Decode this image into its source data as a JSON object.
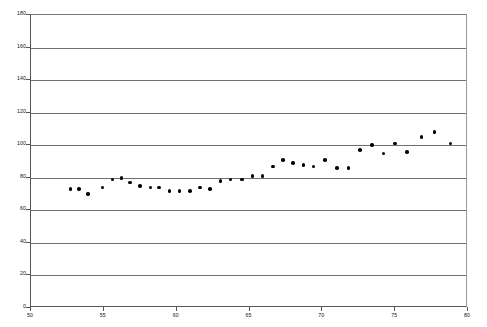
{
  "chart_data": {
    "type": "scatter",
    "title": "",
    "subtitle": "",
    "xlabel": "",
    "ylabel": "",
    "xlim": [
      50,
      80
    ],
    "ylim": [
      0,
      180
    ],
    "xticks": [
      50,
      55,
      60,
      65,
      70,
      75,
      80
    ],
    "yticks": [
      0,
      20,
      40,
      60,
      80,
      100,
      120,
      140,
      160,
      180
    ],
    "xtick_labels": [
      "50",
      "55",
      "60",
      "65",
      "70",
      "75",
      "80"
    ],
    "ytick_labels": [
      "0",
      "20",
      "40",
      "60",
      "80",
      "100",
      "120",
      "140",
      "160",
      "180"
    ],
    "grid": "horizontal",
    "legend": null,
    "annotations": [],
    "marker": {
      "shape": "circle",
      "color": "#000000",
      "size": 3.6
    },
    "series": [
      {
        "name": "series-1",
        "points": [
          {
            "x": 52.7,
            "y": 73
          },
          {
            "x": 53.3,
            "y": 73
          },
          {
            "x": 53.9,
            "y": 70
          },
          {
            "x": 54.9,
            "y": 74
          },
          {
            "x": 55.6,
            "y": 79
          },
          {
            "x": 56.2,
            "y": 80
          },
          {
            "x": 56.8,
            "y": 77
          },
          {
            "x": 57.5,
            "y": 75
          },
          {
            "x": 58.2,
            "y": 74
          },
          {
            "x": 58.8,
            "y": 74
          },
          {
            "x": 59.5,
            "y": 72
          },
          {
            "x": 60.2,
            "y": 72
          },
          {
            "x": 60.9,
            "y": 72
          },
          {
            "x": 61.6,
            "y": 74
          },
          {
            "x": 62.3,
            "y": 73
          },
          {
            "x": 63.0,
            "y": 78
          },
          {
            "x": 63.7,
            "y": 79
          },
          {
            "x": 64.5,
            "y": 79
          },
          {
            "x": 65.2,
            "y": 81
          },
          {
            "x": 65.9,
            "y": 81
          },
          {
            "x": 66.6,
            "y": 87
          },
          {
            "x": 67.3,
            "y": 91
          },
          {
            "x": 68.0,
            "y": 89
          },
          {
            "x": 68.7,
            "y": 88
          },
          {
            "x": 69.4,
            "y": 87
          },
          {
            "x": 70.2,
            "y": 91
          },
          {
            "x": 71.0,
            "y": 86
          },
          {
            "x": 71.8,
            "y": 86
          },
          {
            "x": 72.6,
            "y": 97
          },
          {
            "x": 73.4,
            "y": 100
          },
          {
            "x": 74.2,
            "y": 95
          },
          {
            "x": 75.0,
            "y": 101
          },
          {
            "x": 75.8,
            "y": 96
          },
          {
            "x": 76.8,
            "y": 105
          },
          {
            "x": 77.7,
            "y": 108
          },
          {
            "x": 78.8,
            "y": 101
          }
        ]
      }
    ]
  },
  "axes": {
    "plot_left_px": 30,
    "plot_top_px": 14,
    "plot_width_px": 437,
    "plot_height_px": 293
  }
}
